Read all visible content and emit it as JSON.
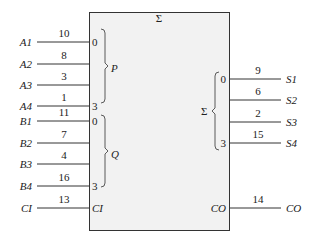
{
  "diagram": {
    "type": "4-bit binary adder logic symbol",
    "title": "Σ",
    "box_fill": "#f2f2f2",
    "line_color": "#333333",
    "inputs": [
      {
        "name": "A1",
        "pin": "10",
        "bit": "0",
        "y": 42
      },
      {
        "name": "A2",
        "pin": "8",
        "bit": "",
        "y": 64
      },
      {
        "name": "A3",
        "pin": "3",
        "bit": "",
        "y": 85
      },
      {
        "name": "A4",
        "pin": "1",
        "bit": "3",
        "y": 106
      },
      {
        "name": "B1",
        "pin": "11",
        "bit": "0",
        "y": 121
      },
      {
        "name": "B2",
        "pin": "7",
        "bit": "",
        "y": 143
      },
      {
        "name": "B3",
        "pin": "4",
        "bit": "",
        "y": 164
      },
      {
        "name": "B4",
        "pin": "16",
        "bit": "3",
        "y": 186
      },
      {
        "name": "CI",
        "pin": "13",
        "bit": "CI",
        "y": 208
      }
    ],
    "outputs": [
      {
        "name": "S1",
        "pin": "9",
        "bit": "0",
        "y": 79
      },
      {
        "name": "S2",
        "pin": "6",
        "bit": "",
        "y": 100
      },
      {
        "name": "S3",
        "pin": "2",
        "bit": "",
        "y": 122
      },
      {
        "name": "S4",
        "pin": "15",
        "bit": "3",
        "y": 143
      },
      {
        "name": "CO",
        "pin": "14",
        "bit": "CO",
        "y": 208
      }
    ],
    "groups": {
      "P": "P",
      "Q": "Q",
      "Sum": "Σ"
    }
  }
}
